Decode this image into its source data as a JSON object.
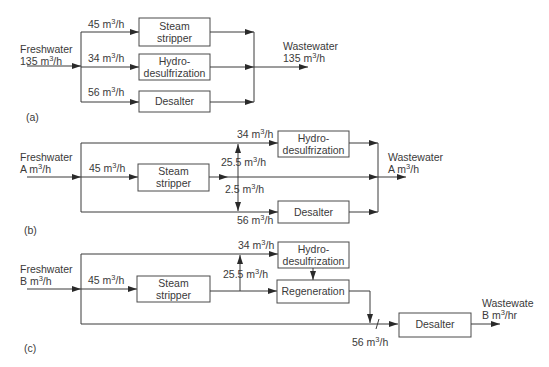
{
  "diagram_a": {
    "label": "(a)",
    "input": {
      "line1": "Freshwater",
      "line2": "135 m",
      "unit_exp": "3",
      "unit_tail": "/h"
    },
    "output": {
      "line1": "Wastewater",
      "line2": "135 m",
      "unit_exp": "3",
      "unit_tail": "/h"
    },
    "units": [
      {
        "name": "Steam stripper",
        "line1": "Steam",
        "line2": "stripper",
        "flow": "45 m",
        "flow_exp": "3",
        "flow_tail": "/h"
      },
      {
        "name": "Hydro-desulfrization",
        "line1": "Hydro-",
        "line2": "desulfrization",
        "flow": "34 m",
        "flow_exp": "3",
        "flow_tail": "/h"
      },
      {
        "name": "Desalter",
        "line1": "Desalter",
        "flow": "56 m",
        "flow_exp": "3",
        "flow_tail": "/h"
      }
    ]
  },
  "diagram_b": {
    "label": "(b)",
    "input": {
      "line1": "Freshwater",
      "line2": "A m",
      "unit_exp": "3",
      "unit_tail": "/h"
    },
    "output": {
      "line1": "Wastewater",
      "line2": "A m",
      "unit_exp": "3",
      "unit_tail": "/h"
    },
    "steam_stripper": {
      "line1": "Steam",
      "line2": "stripper",
      "flow": "45 m",
      "flow_exp": "3",
      "flow_tail": "/h"
    },
    "hydro": {
      "line1": "Hydro-",
      "line2": "desulfrization",
      "flow": "34 m",
      "flow_exp": "3",
      "flow_tail": "/h"
    },
    "desalter": {
      "line1": "Desalter",
      "flow": "56 m",
      "flow_exp": "3",
      "flow_tail": "/h"
    },
    "reuse_up": {
      "flow": "25.5 m",
      "flow_exp": "3",
      "flow_tail": "/h"
    },
    "reuse_down": {
      "flow": "2.5 m",
      "flow_exp": "3",
      "flow_tail": "/h"
    }
  },
  "diagram_c": {
    "label": "(c)",
    "input": {
      "line1": "Freshwater",
      "line2": "B m",
      "unit_exp": "3",
      "unit_tail": "/h"
    },
    "output": {
      "line1": "Wastewate",
      "line2": "B m",
      "unit_exp": "3",
      "unit_tail": "/hr"
    },
    "steam_stripper": {
      "line1": "Steam",
      "line2": "stripper",
      "flow": "45 m",
      "flow_exp": "3",
      "flow_tail": "/h"
    },
    "hydro": {
      "line1": "Hydro-",
      "line2": "desulfrization",
      "flow": "34 m",
      "flow_exp": "3",
      "flow_tail": "/h"
    },
    "regeneration": {
      "line1": "Regeneration"
    },
    "desalter": {
      "line1": "Desalter",
      "flow": "56 m",
      "flow_exp": "3",
      "flow_tail": "/h"
    },
    "reuse_up": {
      "flow": "25.5 m",
      "flow_exp": "3",
      "flow_tail": "/h"
    }
  }
}
